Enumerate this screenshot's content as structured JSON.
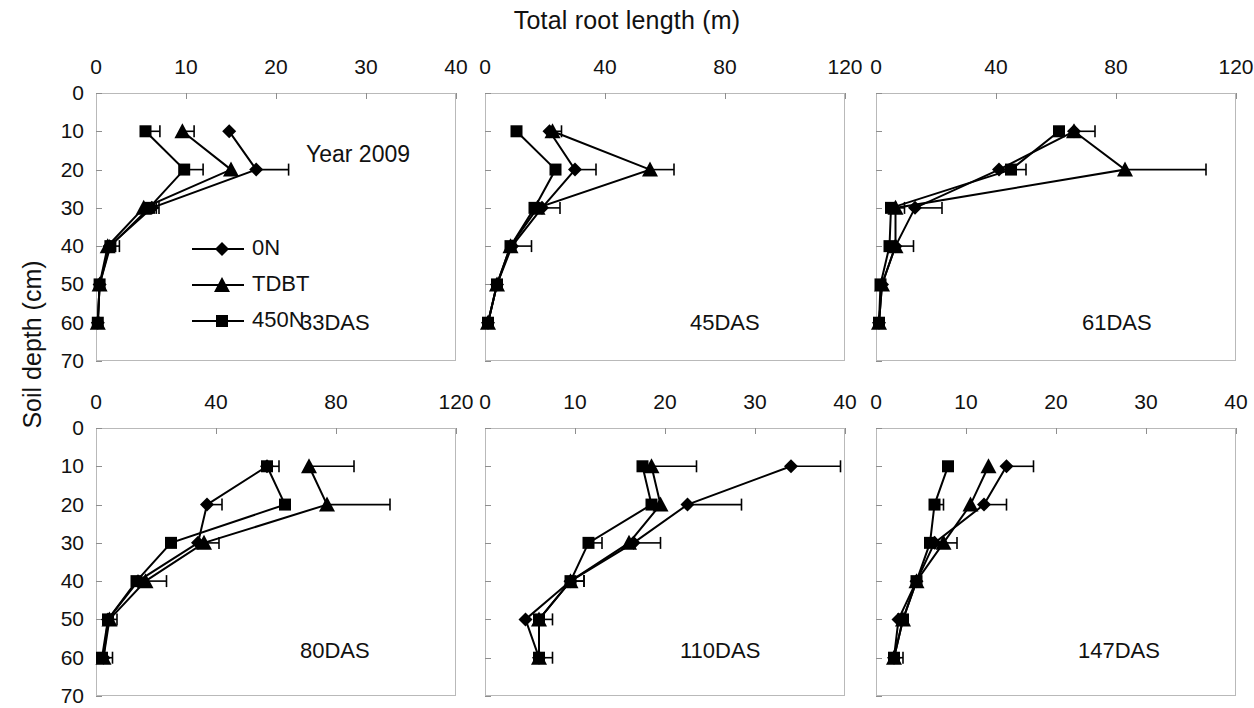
{
  "figure": {
    "title": "Total root length (m)",
    "ylabel": "Soil depth (cm)",
    "year_annotation": "Year 2009"
  },
  "legend": {
    "items": [
      {
        "label": "0N",
        "marker": "diamond"
      },
      {
        "label": "TDBT",
        "marker": "triangle"
      },
      {
        "label": "450N",
        "marker": "square"
      }
    ]
  },
  "chart_data": [
    {
      "type": "line",
      "title": "33DAS",
      "xlabel": "Total root length (m)",
      "ylabel": "Soil depth (cm)",
      "xlim": [
        0,
        40
      ],
      "ylim": [
        0,
        70
      ],
      "xticks": [
        0,
        10,
        20,
        30,
        40
      ],
      "yticks": [
        0,
        10,
        20,
        30,
        40,
        50,
        60,
        70
      ],
      "orientation": "depth-profile",
      "grid": false,
      "legend_position": "inside-left",
      "depths": [
        10,
        20,
        30,
        40,
        50,
        60
      ],
      "series": [
        {
          "name": "0N",
          "marker": "diamond",
          "values": [
            14.8,
            17.8,
            6.2,
            1.5,
            0.4,
            0.2
          ],
          "errors": [
            0.0,
            3.6,
            0.8,
            0.6,
            0.2,
            0.1
          ]
        },
        {
          "name": "TDBT",
          "marker": "triangle",
          "values": [
            9.6,
            15.0,
            5.3,
            1.3,
            0.4,
            0.2
          ],
          "errors": [
            1.3,
            0.0,
            0.0,
            1.3,
            0.2,
            0.1
          ]
        },
        {
          "name": "450N",
          "marker": "square",
          "values": [
            5.5,
            9.8,
            5.9,
            1.6,
            0.4,
            0.2
          ],
          "errors": [
            1.6,
            2.1,
            0.8,
            0.0,
            0.2,
            0.1
          ]
        }
      ]
    },
    {
      "type": "line",
      "title": "45DAS",
      "xlabel": "Total root length (m)",
      "ylabel": "Soil depth (cm)",
      "xlim": [
        0,
        120
      ],
      "ylim": [
        0,
        70
      ],
      "xticks": [
        0,
        40,
        80,
        120
      ],
      "yticks": [
        0,
        10,
        20,
        30,
        40,
        50,
        60,
        70
      ],
      "orientation": "depth-profile",
      "grid": false,
      "legend_position": "none",
      "depths": [
        10,
        20,
        30,
        40,
        50,
        60
      ],
      "series": [
        {
          "name": "0N",
          "marker": "diamond",
          "values": [
            21.5,
            30.0,
            19.0,
            9.0,
            4.0,
            1.0
          ],
          "errors": [
            4.0,
            7.0,
            6.0,
            0.0,
            0.0,
            0.0
          ]
        },
        {
          "name": "TDBT",
          "marker": "triangle",
          "values": [
            22.5,
            55.0,
            17.5,
            8.5,
            4.0,
            1.0
          ],
          "errors": [
            0.0,
            8.0,
            0.0,
            7.0,
            0.0,
            0.0
          ]
        },
        {
          "name": "450N",
          "marker": "square",
          "values": [
            10.5,
            23.5,
            16.5,
            8.5,
            4.0,
            1.0
          ],
          "errors": [
            0.0,
            0.0,
            0.0,
            0.0,
            0.0,
            0.0
          ]
        }
      ]
    },
    {
      "type": "line",
      "title": "61DAS",
      "xlabel": "Total root length (m)",
      "ylabel": "Soil depth (cm)",
      "xlim": [
        0,
        120
      ],
      "ylim": [
        0,
        70
      ],
      "xticks": [
        0,
        40,
        80,
        120
      ],
      "yticks": [
        0,
        10,
        20,
        30,
        40,
        50,
        60,
        70
      ],
      "orientation": "depth-profile",
      "grid": false,
      "legend_position": "none",
      "depths": [
        10,
        20,
        30,
        40,
        50,
        60
      ],
      "series": [
        {
          "name": "0N",
          "marker": "diamond",
          "values": [
            66.0,
            41.0,
            13.0,
            6.5,
            2.0,
            1.0
          ],
          "errors": [
            7.0,
            0.0,
            9.0,
            6.0,
            1.0,
            0.0
          ]
        },
        {
          "name": "TDBT",
          "marker": "triangle",
          "values": [
            66.0,
            83.0,
            6.5,
            6.5,
            2.0,
            1.0
          ],
          "errors": [
            0.0,
            27.0,
            3.0,
            0.0,
            0.0,
            0.0
          ]
        },
        {
          "name": "450N",
          "marker": "square",
          "values": [
            61.0,
            45.0,
            5.0,
            4.5,
            1.5,
            1.0
          ],
          "errors": [
            0.0,
            5.0,
            0.0,
            0.0,
            1.0,
            0.0
          ]
        }
      ]
    },
    {
      "type": "line",
      "title": "80DAS",
      "xlabel": "Total root length (m)",
      "ylabel": "Soil depth (cm)",
      "xlim": [
        0,
        120
      ],
      "ylim": [
        0,
        70
      ],
      "xticks": [
        0,
        40,
        80,
        120
      ],
      "yticks": [
        0,
        10,
        20,
        30,
        40,
        50,
        60,
        70
      ],
      "orientation": "depth-profile",
      "grid": false,
      "legend_position": "none",
      "depths": [
        10,
        20,
        30,
        40,
        50,
        60
      ],
      "series": [
        {
          "name": "0N",
          "marker": "diamond",
          "values": [
            57.0,
            37.0,
            34.0,
            14.0,
            4.0,
            2.5
          ],
          "errors": [
            4.0,
            5.0,
            0.0,
            0.0,
            3.0,
            3.0
          ]
        },
        {
          "name": "TDBT",
          "marker": "triangle",
          "values": [
            71.0,
            77.0,
            36.0,
            16.5,
            4.5,
            2.5
          ],
          "errors": [
            15.0,
            21.0,
            5.0,
            7.0,
            0.0,
            0.0
          ]
        },
        {
          "name": "450N",
          "marker": "square",
          "values": [
            57.0,
            63.0,
            25.0,
            13.5,
            4.0,
            2.0
          ],
          "errors": [
            0.0,
            0.0,
            0.0,
            0.0,
            0.0,
            0.0
          ]
        }
      ]
    },
    {
      "type": "line",
      "title": "110DAS",
      "xlabel": "Total root length (m)",
      "ylabel": "Soil depth (cm)",
      "xlim": [
        0,
        40
      ],
      "ylim": [
        0,
        70
      ],
      "xticks": [
        0,
        10,
        20,
        30,
        40
      ],
      "yticks": [
        0,
        10,
        20,
        30,
        40,
        50,
        60,
        70
      ],
      "orientation": "depth-profile",
      "grid": false,
      "legend_position": "none",
      "depths": [
        10,
        20,
        30,
        40,
        50,
        60
      ],
      "series": [
        {
          "name": "0N",
          "marker": "diamond",
          "values": [
            34.0,
            22.5,
            16.5,
            9.5,
            4.5,
            6.0
          ],
          "errors": [
            5.5,
            6.0,
            3.0,
            1.5,
            0.0,
            0.0
          ]
        },
        {
          "name": "TDBT",
          "marker": "triangle",
          "values": [
            18.5,
            19.5,
            16.0,
            9.5,
            6.0,
            6.0
          ],
          "errors": [
            5.0,
            0.0,
            0.0,
            1.5,
            1.5,
            1.5
          ]
        },
        {
          "name": "450N",
          "marker": "square",
          "values": [
            17.5,
            18.5,
            11.5,
            9.5,
            6.0,
            6.0
          ],
          "errors": [
            0.0,
            0.0,
            1.5,
            0.0,
            0.0,
            0.0
          ]
        }
      ]
    },
    {
      "type": "line",
      "title": "147DAS",
      "xlabel": "Total root length (m)",
      "ylabel": "Soil depth (cm)",
      "xlim": [
        0,
        40
      ],
      "ylim": [
        0,
        70
      ],
      "xticks": [
        0,
        10,
        20,
        30,
        40
      ],
      "yticks": [
        0,
        10,
        20,
        30,
        40,
        50,
        60,
        70
      ],
      "orientation": "depth-profile",
      "grid": false,
      "legend_position": "none",
      "depths": [
        10,
        20,
        30,
        40,
        50,
        60
      ],
      "series": [
        {
          "name": "0N",
          "marker": "diamond",
          "values": [
            14.5,
            12.0,
            6.5,
            4.5,
            2.5,
            2.0
          ],
          "errors": [
            3.0,
            2.5,
            0.0,
            0.0,
            0.0,
            0.0
          ]
        },
        {
          "name": "TDBT",
          "marker": "triangle",
          "values": [
            12.5,
            10.5,
            7.5,
            4.5,
            3.0,
            2.0
          ],
          "errors": [
            0.0,
            0.0,
            1.5,
            0.0,
            0.0,
            1.0
          ]
        },
        {
          "name": "450N",
          "marker": "square",
          "values": [
            8.0,
            6.5,
            6.0,
            4.5,
            3.0,
            2.0
          ],
          "errors": [
            0.0,
            1.0,
            0.0,
            0.0,
            0.0,
            0.0
          ]
        }
      ]
    }
  ]
}
